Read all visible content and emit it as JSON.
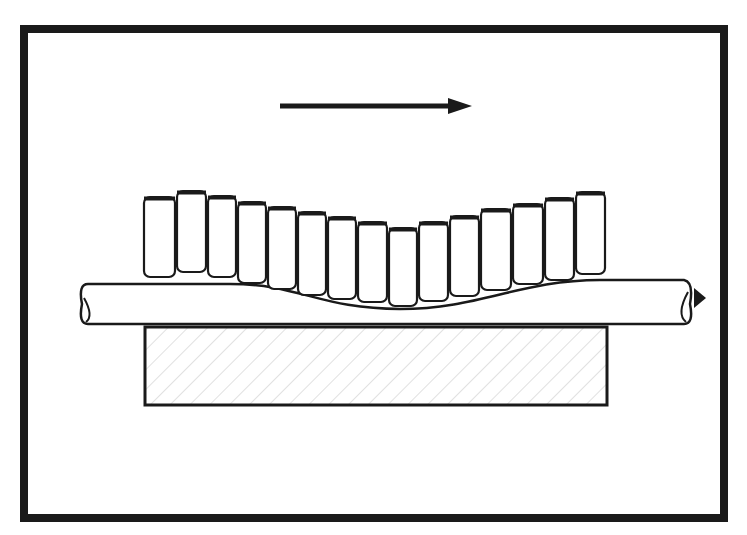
{
  "diagram": {
    "colors": {
      "ink": "#1a1a1a",
      "paper": "#ffffff",
      "hatch": "#9a9a9a"
    },
    "frame": {
      "x": 24,
      "y": 29,
      "width": 700,
      "height": 489,
      "stroke_width": 8
    },
    "direction_arrow": {
      "icon": "arrow-right-icon",
      "x1": 280,
      "y": 106,
      "x2": 472,
      "meaning": "direction of motion"
    },
    "rollers": [
      {
        "x1": 143,
        "x2": 176,
        "top": 197,
        "bottom": 277
      },
      {
        "x1": 176,
        "x2": 207,
        "top": 191,
        "bottom": 272
      },
      {
        "x1": 207,
        "x2": 237,
        "top": 196,
        "bottom": 277
      },
      {
        "x1": 237,
        "x2": 267,
        "top": 202,
        "bottom": 283
      },
      {
        "x1": 267,
        "x2": 297,
        "top": 207,
        "bottom": 289
      },
      {
        "x1": 297,
        "x2": 327,
        "top": 212,
        "bottom": 295
      },
      {
        "x1": 327,
        "x2": 357,
        "top": 217,
        "bottom": 299
      },
      {
        "x1": 357,
        "x2": 388,
        "top": 222,
        "bottom": 302
      },
      {
        "x1": 388,
        "x2": 418,
        "top": 228,
        "bottom": 306
      },
      {
        "x1": 418,
        "x2": 449,
        "top": 222,
        "bottom": 301
      },
      {
        "x1": 449,
        "x2": 480,
        "top": 216,
        "bottom": 296
      },
      {
        "x1": 480,
        "x2": 512,
        "top": 209,
        "bottom": 290
      },
      {
        "x1": 512,
        "x2": 544,
        "top": 204,
        "bottom": 284
      },
      {
        "x1": 544,
        "x2": 575,
        "top": 198,
        "bottom": 280
      },
      {
        "x1": 575,
        "x2": 606,
        "top": 192,
        "bottom": 274
      }
    ],
    "bar": {
      "x1": 82,
      "x2": 690,
      "top": 284,
      "bottom": 324,
      "dip_center_x": 400,
      "dip_depth_y": 309
    },
    "end_arrow": {
      "icon": "arrowhead-right-icon",
      "x": 694,
      "y": 298
    },
    "block": {
      "x": 145,
      "y": 327,
      "width": 462,
      "height": 78,
      "hatched": true
    }
  }
}
